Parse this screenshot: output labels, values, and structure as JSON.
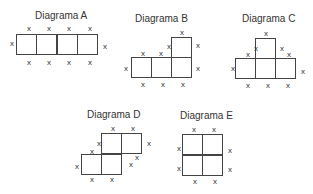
{
  "diagrams": [
    {
      "id": "A",
      "title": "Diagrama A",
      "title_pos": [
        35,
        10
      ],
      "cells": [
        [
          16,
          34
        ],
        [
          36,
          34
        ],
        [
          57,
          34
        ],
        [
          77,
          34
        ]
      ],
      "marks": [
        [
          8,
          40
        ],
        [
          25,
          25
        ],
        [
          45,
          25
        ],
        [
          65,
          25
        ],
        [
          86,
          25
        ],
        [
          101,
          43
        ],
        [
          25,
          59
        ],
        [
          45,
          59
        ],
        [
          65,
          59
        ],
        [
          86,
          59
        ]
      ]
    },
    {
      "id": "B",
      "title": "Diagrama B",
      "title_pos": [
        135,
        13
      ],
      "cells": [
        [
          131,
          57
        ],
        [
          151,
          57
        ],
        [
          171,
          57
        ],
        [
          171,
          37
        ]
      ],
      "marks": [
        [
          122,
          65
        ],
        [
          139,
          50
        ],
        [
          157,
          50
        ],
        [
          165,
          43
        ],
        [
          178,
          29
        ],
        [
          194,
          42
        ],
        [
          194,
          65
        ],
        [
          139,
          81
        ],
        [
          159,
          81
        ],
        [
          179,
          81
        ]
      ]
    },
    {
      "id": "C",
      "title": "Diagrama C",
      "title_pos": [
        242,
        13
      ],
      "cells": [
        [
          235,
          58
        ],
        [
          255,
          58
        ],
        [
          275,
          58
        ],
        [
          255,
          38
        ]
      ],
      "marks": [
        [
          229,
          65
        ],
        [
          244,
          51
        ],
        [
          252,
          45
        ],
        [
          262,
          30
        ],
        [
          278,
          45
        ],
        [
          285,
          51
        ],
        [
          299,
          68
        ],
        [
          244,
          82
        ],
        [
          264,
          82
        ],
        [
          284,
          82
        ]
      ]
    },
    {
      "id": "D",
      "title": "Diagrama D",
      "title_pos": [
        87,
        109
      ],
      "cells": [
        [
          101,
          133
        ],
        [
          121,
          133
        ],
        [
          81,
          154
        ],
        [
          101,
          154
        ]
      ],
      "marks": [
        [
          73,
          163
        ],
        [
          88,
          148
        ],
        [
          95,
          140
        ],
        [
          109,
          125
        ],
        [
          129,
          125
        ],
        [
          145,
          140
        ],
        [
          133,
          154
        ],
        [
          127,
          161
        ],
        [
          88,
          176
        ],
        [
          108,
          176
        ]
      ]
    },
    {
      "id": "E",
      "title": "Diagrama E",
      "title_pos": [
        180,
        110
      ],
      "cells": [
        [
          182,
          134
        ],
        [
          202,
          134
        ],
        [
          182,
          155
        ],
        [
          202,
          155
        ]
      ],
      "marks": [
        [
          175,
          145
        ],
        [
          175,
          165
        ],
        [
          190,
          126
        ],
        [
          210,
          126
        ],
        [
          226,
          147
        ],
        [
          226,
          166
        ],
        [
          191,
          178
        ],
        [
          211,
          178
        ]
      ]
    }
  ],
  "mark_glyph": "x"
}
